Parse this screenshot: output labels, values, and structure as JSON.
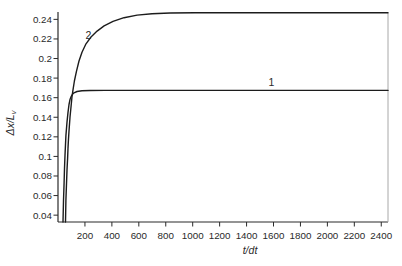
{
  "figure": {
    "background": "#ffffff"
  },
  "chart_data": {
    "type": "line",
    "title": "",
    "xlabel": "t/dt",
    "ylabel": "Δx/L_v",
    "ylabel_main": "Δx/L",
    "ylabel_sub": "v",
    "xlim": [
      0,
      2450
    ],
    "ylim": [
      0.033,
      0.2465
    ],
    "x_ticks": [
      200,
      400,
      600,
      800,
      1000,
      1200,
      1400,
      1600,
      1800,
      2000,
      2200,
      2400
    ],
    "x_tick_labels": [
      "200",
      "400",
      "600",
      "800",
      "1000",
      "1200",
      "1400",
      "1600",
      "1800",
      "2000",
      "2200",
      "2400"
    ],
    "y_ticks": [
      0.04,
      0.06,
      0.08,
      0.1,
      0.12,
      0.14,
      0.16,
      0.18,
      0.2,
      0.22,
      0.24
    ],
    "y_tick_labels": [
      "0.04",
      "0.06",
      "0.08",
      "0.1",
      "0.12",
      "0.14",
      "0.16",
      "0.18",
      "0.2",
      "0.22",
      "0.24"
    ],
    "grid": false,
    "legend": "none",
    "axis_color": "#2a2a2a",
    "right_spine_color": "#a8a8a8",
    "curve_color": "#1c1c1c",
    "series": [
      {
        "name": "1",
        "label": "1",
        "label_xy": [
          1585,
          0.1756
        ],
        "asymptote": 0.167,
        "points": [
          [
            37,
            0.033
          ],
          [
            41,
            0.055
          ],
          [
            45,
            0.073
          ],
          [
            48,
            0.088
          ],
          [
            52,
            0.101
          ],
          [
            59,
            0.121
          ],
          [
            67,
            0.135
          ],
          [
            74,
            0.145
          ],
          [
            82,
            0.153
          ],
          [
            89,
            0.158
          ],
          [
            97,
            0.161
          ],
          [
            108,
            0.1635
          ],
          [
            119,
            0.165
          ],
          [
            141,
            0.1663
          ],
          [
            178,
            0.167
          ],
          [
            238,
            0.1673
          ],
          [
            349,
            0.1674
          ],
          [
            800,
            0.1674
          ],
          [
            2450,
            0.1674
          ]
        ]
      },
      {
        "name": "2",
        "label": "2",
        "label_xy": [
          226,
          0.2237
        ],
        "asymptote": 0.247,
        "points": [
          [
            56,
            0.033
          ],
          [
            59,
            0.055
          ],
          [
            63,
            0.072
          ],
          [
            67,
            0.086
          ],
          [
            71,
            0.098
          ],
          [
            74,
            0.1085
          ],
          [
            78,
            0.118
          ],
          [
            82,
            0.126
          ],
          [
            89,
            0.14
          ],
          [
            97,
            0.1515
          ],
          [
            104,
            0.161
          ],
          [
            111,
            0.168
          ],
          [
            122,
            0.177
          ],
          [
            137,
            0.187
          ],
          [
            156,
            0.1975
          ],
          [
            178,
            0.2065
          ],
          [
            208,
            0.215
          ],
          [
            245,
            0.222
          ],
          [
            290,
            0.228
          ],
          [
            342,
            0.2333
          ],
          [
            408,
            0.2379
          ],
          [
            490,
            0.2417
          ],
          [
            587,
            0.2444
          ],
          [
            698,
            0.2458
          ],
          [
            832,
            0.2465
          ],
          [
            1017,
            0.2467
          ],
          [
            1277,
            0.2468
          ],
          [
            2450,
            0.2468
          ]
        ]
      }
    ]
  }
}
